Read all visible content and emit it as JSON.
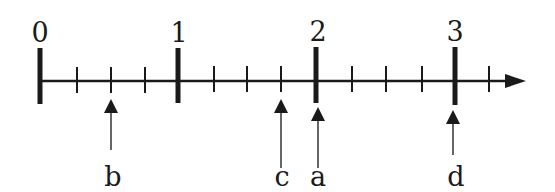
{
  "diagram": {
    "type": "number-line",
    "colors": {
      "ink": "#1a1a1a",
      "arrow_ink": "#333333",
      "background": "#ffffff"
    },
    "axis": {
      "start_value": 0,
      "end_value": 3,
      "subdivisions_per_unit": 4,
      "extra_minor_ticks_after_end": 1,
      "has_arrowhead": true
    },
    "major_labels": [
      "0",
      "1",
      "2",
      "3"
    ],
    "points": [
      {
        "label": "b",
        "value": 0.5
      },
      {
        "label": "c",
        "value": 1.75
      },
      {
        "label": "a",
        "value": 2.0
      },
      {
        "label": "d",
        "value": 3.0
      }
    ]
  }
}
